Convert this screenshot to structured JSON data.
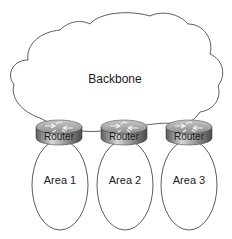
{
  "diagram": {
    "backbone": {
      "label": "Backbone"
    },
    "routers": [
      {
        "label": "Router",
        "area": "Area 1"
      },
      {
        "label": "Router",
        "area": "Area 2"
      },
      {
        "label": "Router",
        "area": "Area 3"
      }
    ],
    "areas": [
      {
        "label": "Area 1"
      },
      {
        "label": "Area 2"
      },
      {
        "label": "Area 3"
      }
    ]
  }
}
